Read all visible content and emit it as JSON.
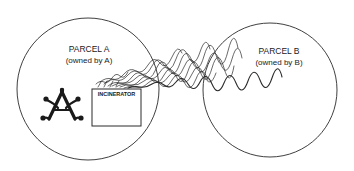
{
  "diagram": {
    "type": "two-parcel externality illustration",
    "parcel_a": {
      "title": "PARCEL A",
      "owner": "(owned by A)",
      "circle": {
        "cx": 88,
        "cy": 89,
        "r": 71
      }
    },
    "parcel_b": {
      "title": "PARCEL B",
      "owner": "(owned by B)",
      "circle": {
        "cx": 270,
        "cy": 90,
        "r": 67
      }
    },
    "incinerator": {
      "label": "INCINERATOR"
    },
    "owner_symbol": "stylized-A-icon",
    "smoke": "smoke-plume drifting from incinerator in Parcel A into Parcel B",
    "colors": {
      "line": "#2a2a2a",
      "background": "#ffffff"
    }
  }
}
